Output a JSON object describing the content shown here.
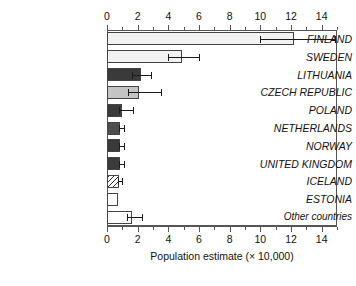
{
  "chart_data": {
    "type": "bar",
    "orientation": "horizontal",
    "title": "",
    "xlabel": "Population estimate (× 10,000)",
    "ylabel": "",
    "xlim": [
      0,
      15
    ],
    "xticks": [
      0,
      2,
      4,
      6,
      8,
      10,
      12,
      14
    ],
    "xtick_labels": [
      "0",
      "2",
      "4",
      "6",
      "8",
      "10",
      "12",
      "14"
    ],
    "minor_tick_step": 1,
    "grid": false,
    "legend": "none",
    "axis_positions": [
      "top",
      "bottom"
    ],
    "categories": [
      "FINLAND",
      "SWEDEN",
      "LITHUANIA",
      "CZECH REPUBLIC",
      "POLAND",
      "NETHERLANDS",
      "NORWAY",
      "UNITED KINGDOM",
      "ICELAND",
      "ESTONIA",
      "Other countries"
    ],
    "values": [
      12.2,
      4.9,
      2.2,
      2.1,
      1.0,
      0.85,
      0.85,
      0.85,
      0.75,
      0.7,
      1.6
    ],
    "error_low": [
      10.0,
      4.0,
      1.6,
      1.4,
      0.8,
      0.8,
      0.8,
      0.8,
      0.7,
      null,
      1.3
    ],
    "error_high": [
      14.9,
      6.0,
      2.9,
      3.5,
      1.7,
      1.1,
      1.1,
      1.1,
      1.0,
      null,
      2.3
    ],
    "fills": [
      "very-light-gray",
      "very-light-gray",
      "dark-gray",
      "light-gray",
      "dark-gray",
      "medium-dark-gray",
      "dark-gray",
      "dark-gray",
      "diagonal-hatch",
      "white",
      "white"
    ],
    "colors": {
      "very-light-gray": "#f2f2f2",
      "light-gray": "#c4c4c4",
      "medium-dark-gray": "#4e4e4e",
      "dark-gray": "#3a3a3a",
      "white": "#ffffff",
      "hatch-stroke": "#2f2f2f",
      "axis": "#555555",
      "text": "#111111"
    }
  }
}
